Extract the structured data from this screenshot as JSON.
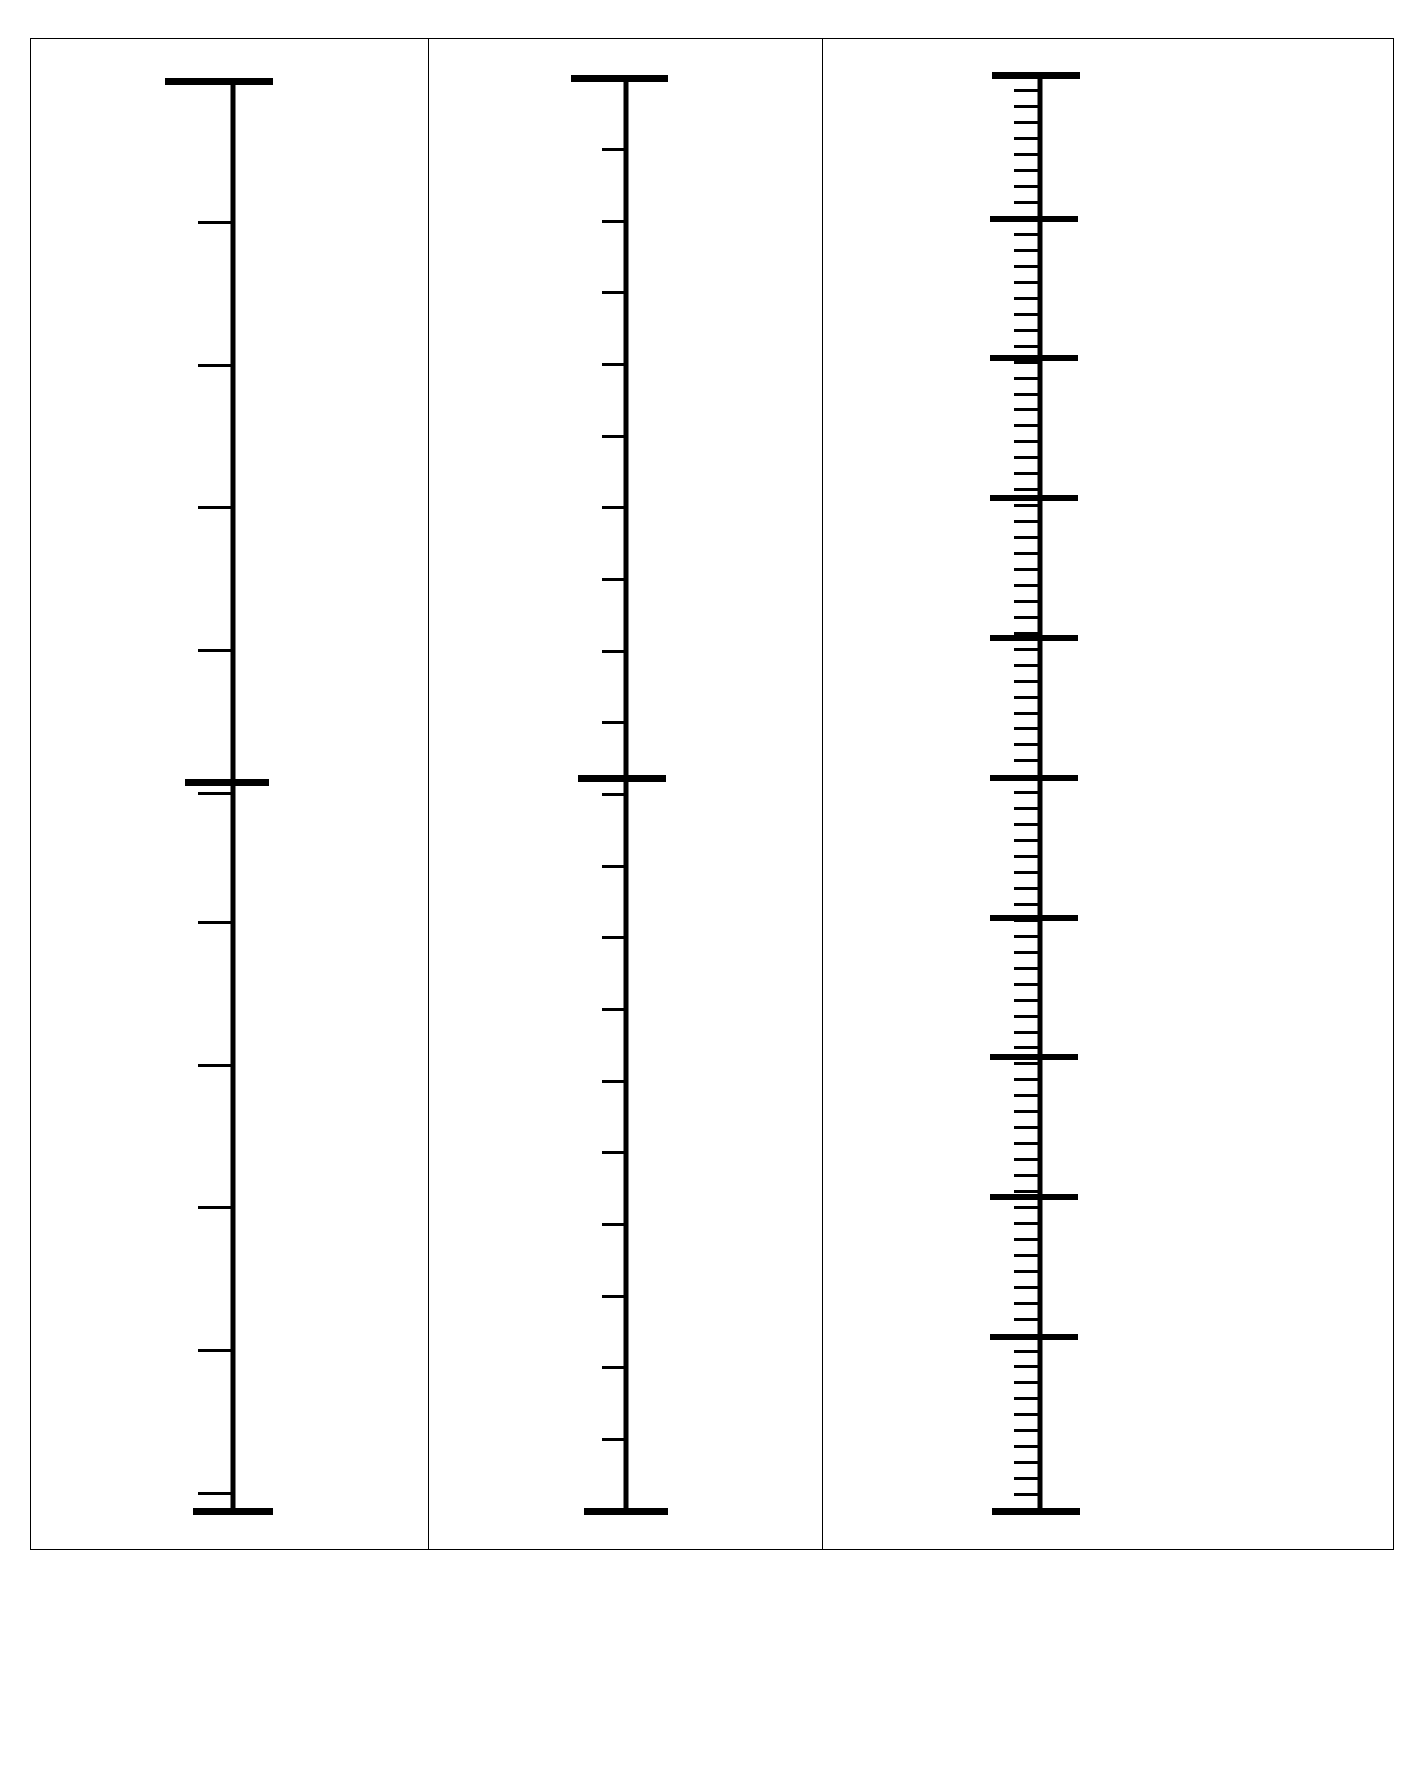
{
  "document": {
    "title": "Three blank measurement scales",
    "background_color": "#ffffff",
    "ink_color": "#000000",
    "page_width": 1425,
    "page_height": 1773
  },
  "chart_data": {
    "type": "table",
    "xlabel": "",
    "ylabel": "",
    "grid": false,
    "legend": false,
    "panels": [
      {
        "name": "scale-coarse",
        "index": 1,
        "orientation": "vertical",
        "tick_side": "left",
        "top_cap": {
          "y": 80,
          "width_left": 68,
          "width_right": 40
        },
        "bottom_cap": {
          "y": 1510,
          "width_left": 40,
          "width_right": 40
        },
        "spine": {
          "x": 232,
          "y_top": 80,
          "y_bottom": 1510
        },
        "minor_tick_count": 10,
        "minor_tick_length": 35,
        "minor_tick_ys": [
          221,
          364,
          506,
          649,
          792,
          921,
          1064,
          1206,
          1349,
          1492
        ],
        "major_tick_ys": [
          781
        ],
        "major_tick_length_left": 48,
        "major_tick_length_right": 36,
        "interval_px": 143
      },
      {
        "name": "scale-medium",
        "index": 2,
        "orientation": "vertical",
        "tick_side": "left",
        "top_cap": {
          "y": 77,
          "width_left": 55,
          "width_right": 42
        },
        "bottom_cap": {
          "y": 1510,
          "width_left": 42,
          "width_right": 42
        },
        "spine": {
          "x": 627,
          "y_top": 77,
          "y_bottom": 1510
        },
        "minor_tick_count": 19,
        "minor_tick_length": 24,
        "major_tick_ys": [
          777
        ],
        "major_tick_length_left": 48,
        "major_tick_length_right": 40,
        "interval_px": 71.6
      },
      {
        "name": "scale-fine",
        "index": 3,
        "orientation": "vertical",
        "tick_side": "left",
        "top_cap": {
          "y": 74,
          "width_left": 48,
          "width_right": 40
        },
        "bottom_cap": {
          "y": 1510,
          "width_left": 48,
          "width_right": 40
        },
        "spine": {
          "x": 1042,
          "y_top": 74,
          "y_bottom": 1510
        },
        "minor_tick_count": 89,
        "minor_tick_length": 26,
        "major_tick_count": 9,
        "major_tick_ys": [
          218,
          357,
          497,
          637,
          777,
          917,
          1056,
          1196,
          1336
        ],
        "major_tick_length_left": 50,
        "major_tick_length_right": 38,
        "interval_px": 15.95
      }
    ]
  }
}
